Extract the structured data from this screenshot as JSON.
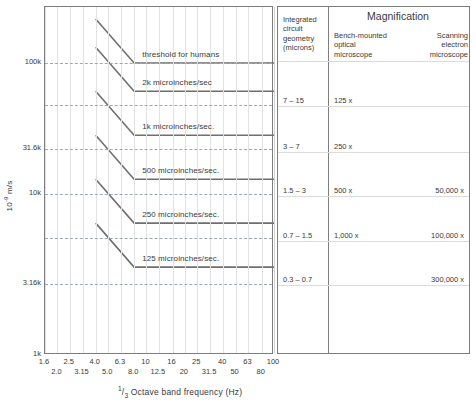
{
  "yaxis": {
    "title_prefix": "10",
    "title_exp": "-9",
    "title_unit": " m/s",
    "labels": [
      {
        "text": "100k",
        "value": 100000,
        "y": 62
      },
      {
        "text": "31.6k",
        "value": 31600,
        "y": 148
      },
      {
        "text": "10k",
        "value": 10000,
        "y": 193
      },
      {
        "text": "3.16k",
        "value": 3160,
        "y": 283
      },
      {
        "text": "1k",
        "value": 1000,
        "y": 354
      }
    ],
    "gridlines_y": [
      62,
      104,
      148,
      193,
      237,
      283
    ],
    "range": [
      1000,
      200000
    ]
  },
  "xaxis": {
    "title_num": "1",
    "title_den": "3",
    "title_rest": " Octave band frequency (Hz)",
    "ticks_upper": [
      "1.6",
      "2.5",
      "4.0",
      "6.3",
      "10",
      "16",
      "25",
      "40",
      "63",
      "100"
    ],
    "ticks_lower": [
      "2.0",
      "3.15",
      "5.0",
      "8.0",
      "12.5",
      "20",
      "31.5",
      "50",
      "80"
    ],
    "range": [
      1.6,
      100
    ]
  },
  "curves": [
    {
      "label": "threshold for humans",
      "knee_hz": 8.0,
      "flat_value": 100000,
      "start_hz": 4.0,
      "start_value": 200000
    },
    {
      "label": "2k microinches/sec",
      "knee_hz": 8.0,
      "flat_value": 64000,
      "start_hz": 4.0,
      "start_value": 128000
    },
    {
      "label": "1k microinches/sec.",
      "knee_hz": 8.0,
      "flat_value": 32000,
      "start_hz": 4.0,
      "start_value": 64000
    },
    {
      "label": "500 microinches/sec.",
      "knee_hz": 8.0,
      "flat_value": 16000,
      "start_hz": 4.0,
      "start_value": 32000
    },
    {
      "label": "250 microinches/sec.",
      "knee_hz": 8.0,
      "flat_value": 8000,
      "start_hz": 4.0,
      "start_value": 16000
    },
    {
      "label": "125 microinches/sec.",
      "knee_hz": 8.0,
      "flat_value": 4000,
      "start_hz": 4.0,
      "start_value": 8000
    }
  ],
  "table": {
    "header": {
      "geometry": "Integrated circuit geometry (microns)",
      "magnification": "Magnification",
      "bench_optical": "Bench-mounted optical microscope",
      "scanning_electron": "Scanning electron microscope"
    },
    "rows": [
      {
        "geometry": "7 – 15",
        "optical": "125 x",
        "electron": "",
        "y": 99
      },
      {
        "geometry": "3 – 7",
        "optical": "250 x",
        "electron": "",
        "y": 145
      },
      {
        "geometry": "1.5 – 3",
        "optical": "500 x",
        "electron": "50,000 x",
        "y": 189
      },
      {
        "geometry": "0.7 – 1.5",
        "optical": "1,000 x",
        "electron": "100,000 x",
        "y": 234
      },
      {
        "geometry": "0.3 – 0.7",
        "optical": "",
        "electron": "300,000 x",
        "y": 278
      }
    ]
  },
  "chart_data": {
    "type": "line",
    "title": "",
    "xlabel": "1/3 Octave band frequency (Hz)",
    "ylabel": "10^-9 m/s",
    "xscale": "log",
    "yscale": "log",
    "xlim": [
      1.6,
      100
    ],
    "ylim": [
      1000,
      200000
    ],
    "grid": true,
    "legend": "inline-annotations",
    "x_tick_labels": [
      "1.6",
      "2.0",
      "2.5",
      "3.15",
      "4.0",
      "5.0",
      "6.3",
      "8.0",
      "10",
      "12.5",
      "16",
      "20",
      "25",
      "31.5",
      "40",
      "50",
      "63",
      "80",
      "100"
    ],
    "y_tick_labels": [
      "1k",
      "3.16k",
      "10k",
      "31.6k",
      "100k"
    ],
    "series": [
      {
        "name": "threshold for humans",
        "x": [
          4.0,
          8.0,
          100
        ],
        "values": [
          200000,
          100000,
          100000
        ]
      },
      {
        "name": "2k microinches/sec",
        "x": [
          4.0,
          8.0,
          100
        ],
        "values": [
          128000,
          64000,
          64000
        ]
      },
      {
        "name": "1k microinches/sec.",
        "x": [
          4.0,
          8.0,
          100
        ],
        "values": [
          64000,
          32000,
          32000
        ]
      },
      {
        "name": "500 microinches/sec.",
        "x": [
          4.0,
          8.0,
          100
        ],
        "values": [
          32000,
          16000,
          16000
        ]
      },
      {
        "name": "250 microinches/sec.",
        "x": [
          4.0,
          8.0,
          100
        ],
        "values": [
          16000,
          8000,
          8000
        ]
      },
      {
        "name": "125 microinches/sec.",
        "x": [
          4.0,
          8.0,
          100
        ],
        "values": [
          8000,
          4000,
          4000
        ]
      }
    ],
    "annotations": [
      {
        "text": "threshold for humans",
        "note": "curve label above flat segment"
      },
      {
        "text": "2k microinches/sec",
        "note": "curve label above flat segment"
      },
      {
        "text": "1k microinches/sec.",
        "note": "curve label above flat segment"
      },
      {
        "text": "500 microinches/sec.",
        "note": "curve label above flat segment"
      },
      {
        "text": "250 microinches/sec.",
        "note": "curve label above flat segment"
      },
      {
        "text": "125 microinches/sec.",
        "note": "curve label above flat segment"
      }
    ],
    "table": {
      "columns": [
        "Integrated circuit geometry (microns)",
        "Bench-mounted optical microscope",
        "Scanning electron microscope"
      ],
      "rows": [
        [
          "7 – 15",
          "125 x",
          ""
        ],
        [
          "3 – 7",
          "250 x",
          ""
        ],
        [
          "1.5 – 3",
          "500 x",
          "50,000 x"
        ],
        [
          "0.7 – 1.5",
          "1,000 x",
          "100,000 x"
        ],
        [
          "0.3 – 0.7",
          "",
          "300,000 x"
        ]
      ]
    }
  },
  "colors": {
    "frame": "#7d7d7d",
    "curve": "#6f6f6f",
    "grid": "#e2e2e2",
    "dashed_grid": "#9fa6b5",
    "text": "#3a3a3a"
  }
}
